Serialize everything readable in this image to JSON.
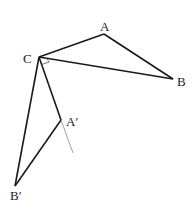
{
  "diagram": {
    "labels": {
      "A": "A",
      "B": "B",
      "C": "C",
      "A_prime": "A′",
      "B_prime": "B′"
    },
    "points": {
      "A": [
        104,
        34
      ],
      "B": [
        173,
        79
      ],
      "C": [
        39,
        57
      ],
      "A_prime": [
        61,
        120
      ],
      "B_prime": [
        15,
        186
      ]
    },
    "segments": [
      {
        "from": "C",
        "to": "A",
        "style": "thick"
      },
      {
        "from": "A",
        "to": "B",
        "style": "thick"
      },
      {
        "from": "C",
        "to": "B",
        "style": "thick"
      },
      {
        "from": "C",
        "to": "A_prime",
        "style": "thick"
      },
      {
        "from": "A_prime",
        "to": "B_prime",
        "style": "thick"
      },
      {
        "from": "C",
        "to": "B_prime",
        "style": "thick"
      },
      {
        "from": "A_prime",
        "to": "extension_end",
        "style": "thin"
      }
    ],
    "extension_end": [
      73,
      153
    ],
    "right_angle_marker_at": "C",
    "colors": {
      "line": "#1a1a1a",
      "thin_line": "#888888",
      "marker": "#555555"
    }
  }
}
